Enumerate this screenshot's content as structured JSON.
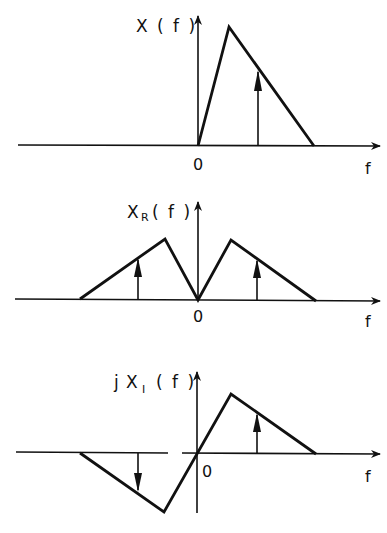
{
  "figure": {
    "panels": [
      {
        "id": "spectrum",
        "ylabel": "X ( f )",
        "zero_label": "0",
        "xlabel": "f",
        "description": "One-sided triangular spectrum with an impulse on its falling edge"
      },
      {
        "id": "real_part",
        "ylabel_main": "X",
        "ylabel_sub": "R",
        "ylabel_tail": "( f )",
        "zero_label": "0",
        "xlabel": "f",
        "description": "Even real part: mirrored triangles with impulses at ±f0"
      },
      {
        "id": "imag_part",
        "ylabel_prefix": "j",
        "ylabel_main": "X",
        "ylabel_sub": "I",
        "ylabel_tail": "( f )",
        "zero_label": "0",
        "xlabel": "f",
        "description": "Odd imaginary part: positive triangle for f>0, inverted triangle for f<0, impulses up/down"
      }
    ]
  }
}
